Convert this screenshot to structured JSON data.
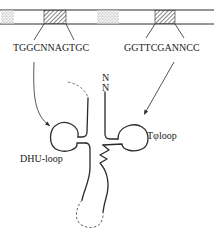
{
  "diagram": {
    "type": "tRNA gene promoter / cloverleaf schematic",
    "dna_strip": {
      "boxes": [
        {
          "name": "A-box",
          "fill": "hatched",
          "sequence": "TGGCNNAGTGC"
        },
        {
          "name": "B-box",
          "fill": "hatched",
          "sequence": "GGTTCGANNCC"
        }
      ],
      "stippled_regions": 2
    },
    "labels": {
      "box_a_sequence": "TGGCNNAGTGC",
      "box_b_sequence": "GGTTCGANNCC",
      "n_top": "N",
      "n_bottom": "N",
      "t_loop": "Tφloop",
      "dhu_loop": "DHU-loop"
    },
    "colors": {
      "line": "#2a2a2a",
      "dashed": "#555555",
      "background": "#ffffff"
    }
  }
}
